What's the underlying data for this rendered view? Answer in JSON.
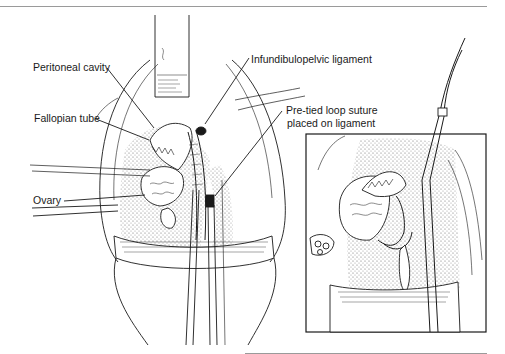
{
  "figure": {
    "labels": {
      "peritoneal_cavity": "Peritoneal cavity",
      "fallopian_tube": "Fallopian tube",
      "ovary": "Ovary",
      "infundibulopelvic_ligament": "Infundibulopelvic ligament",
      "pretied_loop_line1": "Pre-tied loop suture",
      "pretied_loop_line2": "placed on ligament"
    },
    "panels": [
      "main-view",
      "inset-detail-view"
    ],
    "colors": {
      "ink": "#1a1a1a",
      "stipple": "#8c8c8c",
      "rule": "#9a9a9a",
      "background": "#ffffff"
    }
  }
}
